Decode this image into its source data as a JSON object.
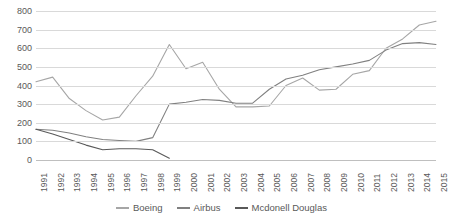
{
  "chart_data": {
    "type": "line",
    "title": "",
    "xlabel": "",
    "ylabel": "",
    "ylim": [
      0,
      800
    ],
    "ytick_step": 100,
    "grid": true,
    "legend_position": "bottom",
    "categories": [
      "1991",
      "1992",
      "1993",
      "1994",
      "1995",
      "1996",
      "1997",
      "1998",
      "1999",
      "2000",
      "2001",
      "2002",
      "2003",
      "2004",
      "2005",
      "2006",
      "2007",
      "2008",
      "2009",
      "2010",
      "2011",
      "2012",
      "2013",
      "2014",
      "2015"
    ],
    "yticks": [
      "0",
      "100",
      "200",
      "300",
      "400",
      "500",
      "600",
      "700",
      "800"
    ],
    "series": [
      {
        "name": "Boeing",
        "color": "#a6a6a6",
        "values": [
          420,
          445,
          330,
          265,
          215,
          230,
          345,
          450,
          620,
          490,
          525,
          380,
          285,
          285,
          290,
          400,
          440,
          375,
          380,
          460,
          480,
          600,
          650,
          725,
          745
        ]
      },
      {
        "name": "Airbus",
        "color": "#808080",
        "values": [
          165,
          160,
          145,
          125,
          110,
          105,
          100,
          120,
          300,
          310,
          325,
          320,
          305,
          305,
          380,
          435,
          455,
          485,
          500,
          515,
          535,
          590,
          625,
          630,
          620
        ]
      },
      {
        "name": "Mcdonell Douglas",
        "color": "#595959",
        "values": [
          165,
          140,
          110,
          80,
          55,
          60,
          60,
          55,
          10,
          null,
          null,
          null,
          null,
          null,
          null,
          null,
          null,
          null,
          null,
          null,
          null,
          null,
          null,
          null,
          null
        ]
      }
    ]
  },
  "legend": {
    "items": [
      {
        "label": "Boeing",
        "color": "#a6a6a6"
      },
      {
        "label": "Airbus",
        "color": "#808080"
      },
      {
        "label": "Mcdonell Douglas",
        "color": "#595959"
      }
    ]
  }
}
